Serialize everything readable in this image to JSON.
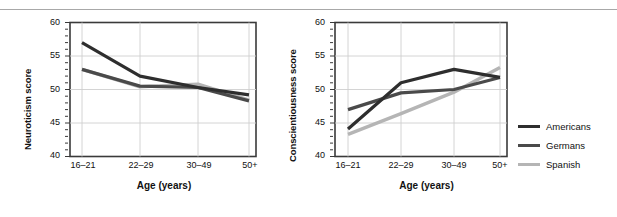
{
  "figure": {
    "panels": [
      {
        "id": "neuroticism",
        "ylabel": "Neuroticism score",
        "xlabel": "Age (years)"
      },
      {
        "id": "conscientiousness",
        "ylabel": "Conscientiousness score",
        "xlabel": "Age (years)"
      }
    ]
  },
  "legend": {
    "position": "right",
    "items": [
      {
        "label": "Americans",
        "color": "#2e2e2e",
        "swatch_icon": "line-swatch-icon"
      },
      {
        "label": "Germans",
        "color": "#4a4a4a",
        "swatch_icon": "line-swatch-icon"
      },
      {
        "label": "Spanish",
        "color": "#b5b5b5",
        "swatch_icon": "line-swatch-icon"
      }
    ]
  },
  "axis": {
    "ytick_labels": [
      "60",
      "55",
      "50",
      "45",
      "40"
    ],
    "xtick_labels": [
      "16–21",
      "22–29",
      "30–49",
      "50+"
    ]
  },
  "chart_data": [
    {
      "type": "line",
      "title": "",
      "xlabel": "Age (years)",
      "ylabel": "Neuroticism score",
      "categories": [
        "16–21",
        "22–29",
        "30–49",
        "50+"
      ],
      "ylim": [
        40,
        60
      ],
      "yticks": [
        40,
        45,
        50,
        55,
        60
      ],
      "minor_ticks": true,
      "grid": true,
      "legend_position": "right",
      "series": [
        {
          "name": "Americans",
          "color": "#2e2e2e",
          "values": [
            57.0,
            52.0,
            50.3,
            49.2
          ]
        },
        {
          "name": "Germans",
          "color": "#4a4a4a",
          "values": [
            53.0,
            50.5,
            50.3,
            48.3
          ]
        },
        {
          "name": "Spanish",
          "color": "#b5b5b5",
          "values": [
            53.0,
            50.4,
            50.8,
            48.4
          ]
        }
      ]
    },
    {
      "type": "line",
      "title": "",
      "xlabel": "Age (years)",
      "ylabel": "Conscientiousness score",
      "categories": [
        "16–21",
        "22–29",
        "30–49",
        "50+"
      ],
      "ylim": [
        40,
        60
      ],
      "yticks": [
        40,
        45,
        50,
        55,
        60
      ],
      "minor_ticks": true,
      "grid": true,
      "legend_position": "right",
      "series": [
        {
          "name": "Americans",
          "color": "#2e2e2e",
          "values": [
            44.1,
            51.0,
            53.0,
            51.8
          ]
        },
        {
          "name": "Germans",
          "color": "#4a4a4a",
          "values": [
            47.0,
            49.5,
            50.0,
            51.8
          ]
        },
        {
          "name": "Spanish",
          "color": "#b5b5b5",
          "values": [
            43.3,
            46.4,
            49.6,
            53.3
          ]
        }
      ]
    }
  ]
}
